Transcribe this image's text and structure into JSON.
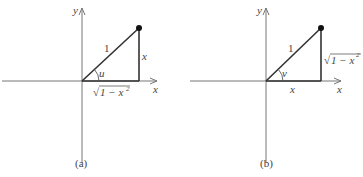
{
  "figures": [
    {
      "id": "a",
      "caption": "(a)",
      "axis_labels": {
        "x": "x",
        "y": "y"
      },
      "hypotenuse_label": "1",
      "angle_label": "u",
      "vertical_side_label": "x",
      "horizontal_side_label": {
        "radical": "√",
        "body": "1 − x",
        "exp": "2"
      }
    },
    {
      "id": "b",
      "caption": "(b)",
      "axis_labels": {
        "x": "x",
        "y": "y"
      },
      "hypotenuse_label": "1",
      "angle_label": "v",
      "vertical_side_label": {
        "radical": "√",
        "body": "1 − x",
        "exp": "2"
      },
      "horizontal_side_label": "x"
    }
  ],
  "colors": {
    "axis": "#777777",
    "triangle": "#333333",
    "point": "#111111"
  }
}
